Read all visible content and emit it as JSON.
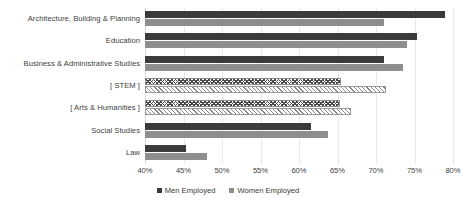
{
  "watermark": {
    "left_text": "",
    "right_text": ""
  },
  "legend": {
    "men_label": "Men Employed",
    "women_label": "Women Employed"
  },
  "colors": {
    "men": "#3b3b3b",
    "women": "#8e8e8e",
    "gridline": "#e9e9e9",
    "text": "#3a3a3a"
  },
  "chart_data": {
    "type": "bar",
    "orientation": "horizontal",
    "title": "",
    "xlabel": "",
    "ylabel": "",
    "xlim": [
      40,
      80
    ],
    "xticks": [
      40,
      45,
      50,
      55,
      60,
      65,
      70,
      75,
      80
    ],
    "xtick_labels": [
      "40%",
      "45%",
      "50%",
      "55%",
      "60%",
      "65%",
      "70%",
      "75%",
      "80%"
    ],
    "grid": true,
    "legend_position": "bottom",
    "categories": [
      "Architecture, Building & Planning",
      "Education",
      "Business & Administrative Studies",
      "[ STEM ]",
      "[ Arts & Humanities ]",
      "Social Studies",
      "Law"
    ],
    "series": [
      {
        "name": "Men Employed",
        "values": [
          79.0,
          75.3,
          71.0,
          65.5,
          65.3,
          61.5,
          45.3
        ],
        "pattern": [
          "solid",
          "solid",
          "solid",
          "chevron-hatch",
          "chevron-hatch",
          "solid",
          "solid"
        ]
      },
      {
        "name": "Women Employed",
        "values": [
          71.0,
          74.0,
          73.5,
          71.3,
          66.8,
          63.8,
          48.0
        ],
        "pattern": [
          "solid",
          "solid",
          "solid",
          "diagonal-hatch",
          "diagonal-hatch",
          "solid",
          "solid"
        ]
      }
    ]
  }
}
